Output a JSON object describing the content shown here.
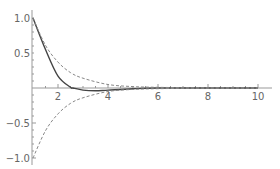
{
  "chart_data": {
    "type": "line",
    "title": "",
    "xlabel": "",
    "ylabel": "",
    "xlim": [
      1,
      10.2
    ],
    "ylim": [
      -1.1,
      1.05
    ],
    "grid": false,
    "legend": null,
    "x_ticks": [
      2,
      4,
      6,
      8,
      10
    ],
    "x_tick_labels": [
      "2",
      "4",
      "6",
      "8",
      "10"
    ],
    "y_ticks": [
      1.0,
      0.5,
      -0.5,
      -1.0
    ],
    "y_tick_labels": [
      "1.0",
      "0.5",
      "-0.5",
      "-1.0"
    ],
    "series": [
      {
        "name": "damped signal",
        "style": "solid",
        "color": "#444444",
        "x": [
          1,
          1.5,
          2,
          2.5,
          2.6,
          3,
          3.5,
          4,
          5,
          6,
          8,
          10
        ],
        "y": [
          1.0,
          0.55,
          0.17,
          0.01,
          0.0,
          -0.03,
          -0.04,
          -0.03,
          -0.01,
          0.0,
          0.0,
          0.0
        ]
      },
      {
        "name": "upper envelope",
        "style": "dashed",
        "color": "#888888",
        "x": [
          1,
          1.5,
          2,
          2.5,
          3,
          4,
          5,
          6,
          8,
          10
        ],
        "y": [
          1.0,
          0.61,
          0.37,
          0.22,
          0.14,
          0.05,
          0.02,
          0.01,
          0.0,
          0.0
        ]
      },
      {
        "name": "lower envelope",
        "style": "dashed",
        "color": "#888888",
        "x": [
          1,
          1.5,
          2,
          2.5,
          3,
          4,
          5,
          6,
          8,
          10
        ],
        "y": [
          -1.0,
          -0.61,
          -0.37,
          -0.22,
          -0.14,
          -0.05,
          -0.02,
          -0.01,
          0.0,
          0.0
        ]
      }
    ]
  },
  "axes": {
    "x_labels": [
      "2",
      "4",
      "6",
      "8",
      "10"
    ],
    "y_labels": [
      "1.0",
      "0.5",
      "-0.5",
      "-1.0"
    ]
  }
}
